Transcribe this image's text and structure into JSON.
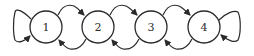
{
  "diagram": {
    "type": "state-transition-chain",
    "nodes": [
      {
        "id": "1",
        "label": "1",
        "cx": 46,
        "cy": 27
      },
      {
        "id": "2",
        "label": "2",
        "cx": 98,
        "cy": 27
      },
      {
        "id": "3",
        "label": "3",
        "cx": 151,
        "cy": 27
      },
      {
        "id": "4",
        "label": "4",
        "cx": 204,
        "cy": 27
      }
    ],
    "node_radius": 16,
    "edges": [
      {
        "from": "1",
        "to": "1",
        "kind": "self-loop",
        "side": "left"
      },
      {
        "from": "1",
        "to": "2",
        "kind": "forward",
        "side": "top"
      },
      {
        "from": "2",
        "to": "3",
        "kind": "forward",
        "side": "top"
      },
      {
        "from": "3",
        "to": "4",
        "kind": "forward",
        "side": "top"
      },
      {
        "from": "2",
        "to": "1",
        "kind": "backward",
        "side": "bottom"
      },
      {
        "from": "3",
        "to": "2",
        "kind": "backward",
        "side": "bottom"
      },
      {
        "from": "4",
        "to": "3",
        "kind": "backward",
        "side": "bottom"
      },
      {
        "from": "4",
        "to": "4",
        "kind": "self-loop",
        "side": "right"
      }
    ],
    "colors": {
      "stroke": "#2a2a2a",
      "fill": "#ffffff",
      "background": "#ffffff"
    }
  }
}
